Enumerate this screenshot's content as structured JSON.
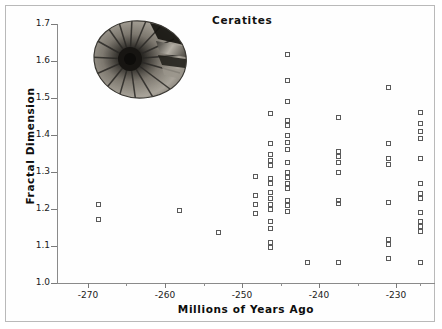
{
  "figure": {
    "title": "Ceratites",
    "inset_image_name": "ammonite-fossil-photo"
  },
  "chart_data": {
    "type": "scatter",
    "title": "Ceratites",
    "xlabel": "Millions of Years Ago",
    "ylabel": "Fractal Dimension",
    "xlim": [
      -274,
      -225
    ],
    "ylim": [
      1.0,
      1.7
    ],
    "xticks": [
      -270,
      -260,
      -250,
      -240,
      -230
    ],
    "xtick_labels": [
      "-270",
      "-260",
      "-250",
      "-240",
      "-230"
    ],
    "xticks_minor": [
      -265,
      -255,
      -245,
      -235,
      -227
    ],
    "yticks": [
      1.0,
      1.1,
      1.2,
      1.3,
      1.4,
      1.5,
      1.6,
      1.7
    ],
    "ytick_labels": [
      "1.0",
      "1.1",
      "1.2",
      "1.3",
      "1.4",
      "1.5",
      "1.6",
      "1.7"
    ],
    "grid": false,
    "legend": null,
    "marker": "open-square",
    "marker_color": "#5a5a5a",
    "points": [
      {
        "x": -268.5,
        "y": 1.212
      },
      {
        "x": -268.5,
        "y": 1.171
      },
      {
        "x": -258.0,
        "y": 1.195
      },
      {
        "x": -253.0,
        "y": 1.134
      },
      {
        "x": -248.2,
        "y": 1.286
      },
      {
        "x": -248.2,
        "y": 1.234
      },
      {
        "x": -248.2,
        "y": 1.211
      },
      {
        "x": -248.2,
        "y": 1.186
      },
      {
        "x": -246.2,
        "y": 1.456
      },
      {
        "x": -246.2,
        "y": 1.375
      },
      {
        "x": -246.2,
        "y": 1.347
      },
      {
        "x": -246.2,
        "y": 1.331
      },
      {
        "x": -246.2,
        "y": 1.316
      },
      {
        "x": -246.2,
        "y": 1.282
      },
      {
        "x": -246.2,
        "y": 1.267
      },
      {
        "x": -246.2,
        "y": 1.242
      },
      {
        "x": -246.2,
        "y": 1.227
      },
      {
        "x": -246.2,
        "y": 1.212
      },
      {
        "x": -246.2,
        "y": 1.196
      },
      {
        "x": -246.2,
        "y": 1.165
      },
      {
        "x": -246.2,
        "y": 1.146
      },
      {
        "x": -246.2,
        "y": 1.107
      },
      {
        "x": -246.2,
        "y": 1.094
      },
      {
        "x": -244.0,
        "y": 1.616
      },
      {
        "x": -244.0,
        "y": 1.546
      },
      {
        "x": -244.0,
        "y": 1.489
      },
      {
        "x": -244.0,
        "y": 1.437
      },
      {
        "x": -244.0,
        "y": 1.424
      },
      {
        "x": -244.0,
        "y": 1.397
      },
      {
        "x": -244.0,
        "y": 1.378
      },
      {
        "x": -244.0,
        "y": 1.36
      },
      {
        "x": -244.0,
        "y": 1.324
      },
      {
        "x": -244.0,
        "y": 1.296
      },
      {
        "x": -244.0,
        "y": 1.283
      },
      {
        "x": -244.0,
        "y": 1.268
      },
      {
        "x": -244.0,
        "y": 1.253
      },
      {
        "x": -244.0,
        "y": 1.222
      },
      {
        "x": -244.0,
        "y": 1.207
      },
      {
        "x": -244.0,
        "y": 1.192
      },
      {
        "x": -241.5,
        "y": 1.054
      },
      {
        "x": -237.5,
        "y": 1.447
      },
      {
        "x": -237.5,
        "y": 1.355
      },
      {
        "x": -237.5,
        "y": 1.341
      },
      {
        "x": -237.5,
        "y": 1.325
      },
      {
        "x": -237.5,
        "y": 1.296
      },
      {
        "x": -237.5,
        "y": 1.222
      },
      {
        "x": -237.5,
        "y": 1.214
      },
      {
        "x": -237.5,
        "y": 1.054
      },
      {
        "x": -231.0,
        "y": 1.527
      },
      {
        "x": -231.0,
        "y": 1.377
      },
      {
        "x": -231.0,
        "y": 1.335
      },
      {
        "x": -231.0,
        "y": 1.318
      },
      {
        "x": -231.0,
        "y": 1.217
      },
      {
        "x": -231.0,
        "y": 1.117
      },
      {
        "x": -231.0,
        "y": 1.104
      },
      {
        "x": -231.0,
        "y": 1.065
      },
      {
        "x": -226.8,
        "y": 1.459
      },
      {
        "x": -226.8,
        "y": 1.43
      },
      {
        "x": -226.8,
        "y": 1.409
      },
      {
        "x": -226.8,
        "y": 1.389
      },
      {
        "x": -226.8,
        "y": 1.335
      },
      {
        "x": -226.8,
        "y": 1.268
      },
      {
        "x": -226.8,
        "y": 1.24
      },
      {
        "x": -226.8,
        "y": 1.228
      },
      {
        "x": -226.8,
        "y": 1.19
      },
      {
        "x": -226.8,
        "y": 1.166
      },
      {
        "x": -226.8,
        "y": 1.152
      },
      {
        "x": -226.8,
        "y": 1.137
      },
      {
        "x": -226.8,
        "y": 1.054
      }
    ]
  }
}
